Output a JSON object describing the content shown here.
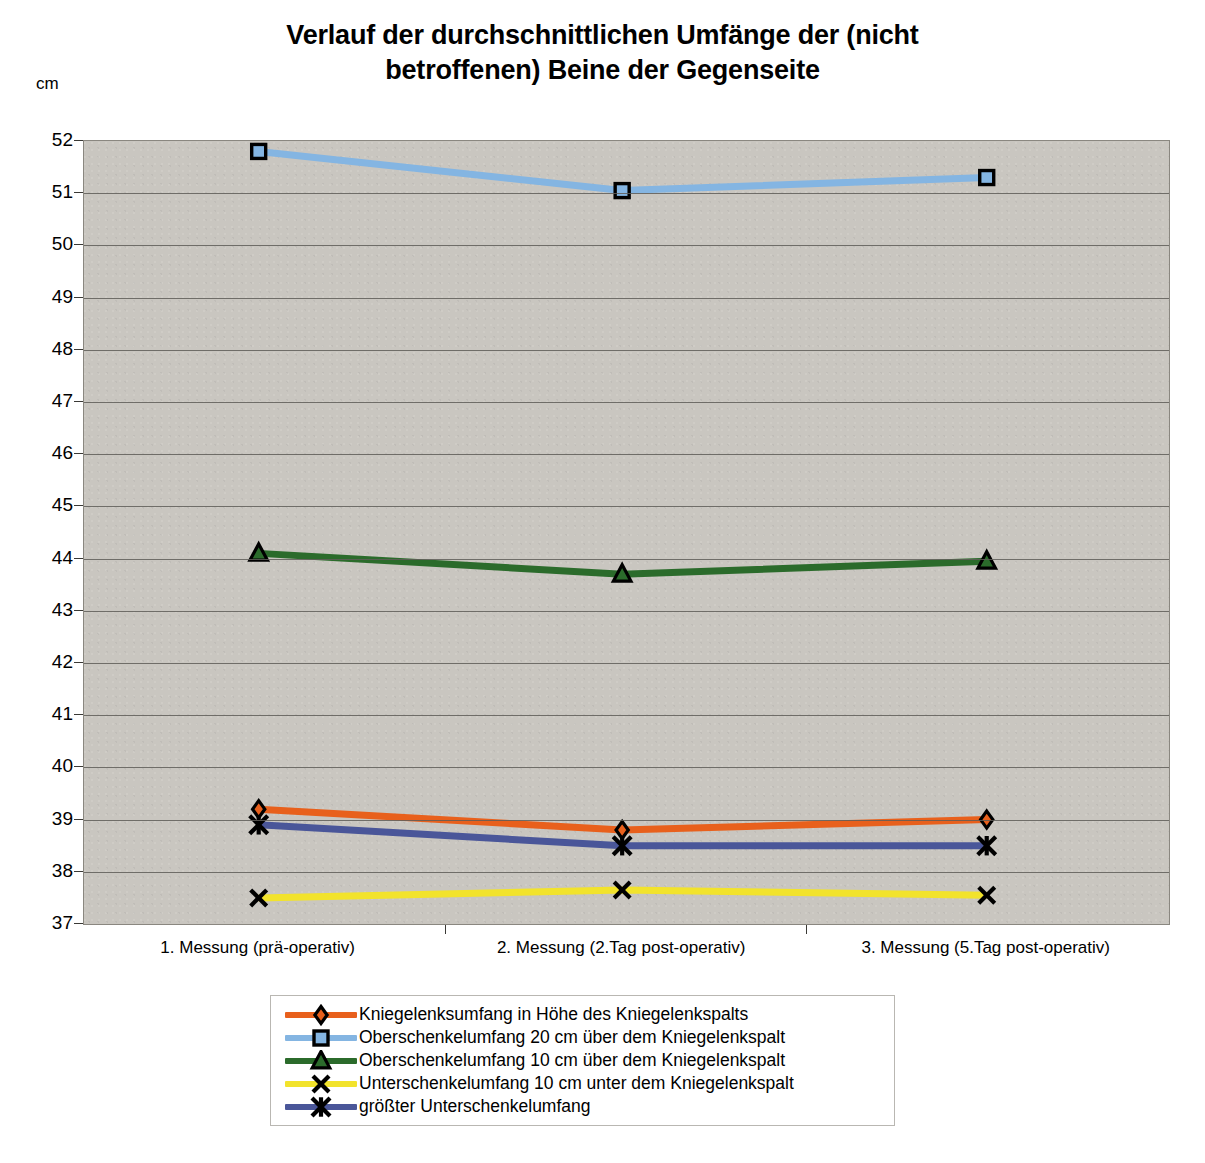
{
  "chart_data": {
    "type": "line",
    "title": "Verlauf der durchschnittlichen Umfänge der (nicht betroffenen) Beine der Gegenseite",
    "title_line1": "Verlauf der durchschnittlichen Umfänge der (nicht",
    "title_line2": "betroffenen) Beine der Gegenseite",
    "xlabel": "",
    "ylabel": "cm",
    "unit_label": "cm",
    "ylim": [
      37,
      52
    ],
    "ytick_step": 1,
    "yticks": [
      52,
      51,
      50,
      49,
      48,
      47,
      46,
      45,
      44,
      43,
      42,
      41,
      40,
      39,
      38,
      37
    ],
    "grid": true,
    "grid_axis": "y",
    "legend_position": "bottom",
    "plot_background": "#c9c6c0",
    "categories": [
      "1. Messung (prä-operativ)",
      "2. Messung (2.Tag post-operativ)",
      "3. Messung (5.Tag post-operativ)"
    ],
    "series": [
      {
        "name": "Kniegelenksumfang in Höhe des Kniegelenkspalts",
        "color": "#E8601C",
        "marker": "diamond",
        "values": [
          39.2,
          38.8,
          39.0
        ]
      },
      {
        "name": "Oberschenkelumfang 20 cm über dem Kniegelenkspalt",
        "color": "#84B5E2",
        "marker": "square",
        "values": [
          51.8,
          51.05,
          51.3
        ]
      },
      {
        "name": "Oberschenkelumfang 10 cm über dem Kniegelenkspalt",
        "color": "#2B6B2B",
        "marker": "triangle",
        "values": [
          44.1,
          43.7,
          43.95
        ]
      },
      {
        "name": "Unterschenkelumfang 10 cm unter dem Kniegelenkspalt",
        "color": "#F2E32C",
        "marker": "x",
        "values": [
          37.5,
          37.65,
          37.55
        ]
      },
      {
        "name": "größter Unterschenkelumfang",
        "color": "#4A5699",
        "marker": "star",
        "values": [
          38.9,
          38.5,
          38.5
        ]
      }
    ]
  }
}
